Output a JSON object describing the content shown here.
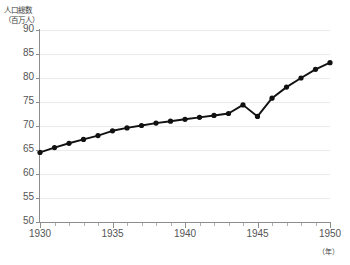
{
  "chart_data": {
    "type": "line",
    "title": "",
    "ylabel": "人口総数\n（百万人）",
    "ylabel_line1": "人口総数",
    "ylabel_line2": "（百万人）",
    "xlabel": "（年）",
    "xlim": [
      1930,
      1950
    ],
    "ylim": [
      50,
      90
    ],
    "y_ticks": [
      50,
      55,
      60,
      65,
      70,
      75,
      80,
      85,
      90
    ],
    "x_ticks": [
      1930,
      1935,
      1940,
      1945,
      1950
    ],
    "x_tick_labels": [
      "1930",
      "1935",
      "1940",
      "1945",
      "1950"
    ],
    "y_tick_labels": [
      "50",
      "55",
      "60",
      "65",
      "70",
      "75",
      "80",
      "85",
      "90"
    ],
    "grid": true,
    "legend": "none",
    "marker": "circle",
    "marker_color": "#111111",
    "line_color": "#111111",
    "x": [
      1930,
      1931,
      1932,
      1933,
      1934,
      1935,
      1936,
      1937,
      1938,
      1939,
      1940,
      1941,
      1942,
      1943,
      1944,
      1945,
      1946,
      1947,
      1948,
      1949,
      1950
    ],
    "values": [
      64.5,
      65.5,
      66.4,
      67.2,
      68.0,
      69.0,
      69.6,
      70.1,
      70.6,
      71.0,
      71.4,
      71.8,
      72.2,
      72.6,
      74.4,
      72.0,
      75.8,
      78.1,
      80.0,
      81.8,
      83.2
    ],
    "annotations": []
  }
}
